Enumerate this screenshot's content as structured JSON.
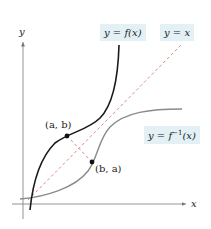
{
  "diagram": {
    "axes": {
      "x_label": "x",
      "y_label": "y"
    },
    "curves": {
      "f": {
        "label": "y = f(x)",
        "color": "#1a1a1a"
      },
      "identity": {
        "label": "y = x",
        "color": "#e07a7a",
        "style": "dashed"
      },
      "inverse": {
        "label_prefix": "y = f",
        "label_sup": "−1",
        "label_suffix": "(x)",
        "color": "#8a8a8a"
      }
    },
    "points": [
      {
        "label": "(a, b)",
        "on": "f"
      },
      {
        "label": "(b, a)",
        "on": "inverse"
      }
    ],
    "label_bg_color": "#e3f1f6"
  }
}
